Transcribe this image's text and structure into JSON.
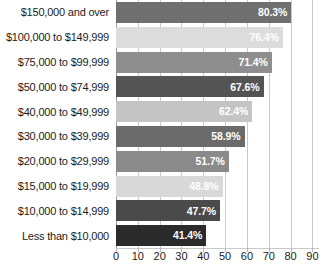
{
  "chart_data": {
    "type": "bar",
    "orientation": "horizontal",
    "title": "",
    "subtitle": "",
    "xlabel": "",
    "ylabel": "",
    "xlim": [
      0,
      93
    ],
    "grid": true,
    "legend": false,
    "value_suffix": "%",
    "xticks": [
      0,
      10,
      20,
      30,
      40,
      50,
      60,
      70,
      80,
      90
    ],
    "xtick_labels": [
      "0",
      "10",
      "20",
      "30",
      "40",
      "50",
      "60",
      "70",
      "80",
      "90"
    ],
    "categories": [
      "$150,000 and over",
      "$100,000 to $149,999",
      "$75,000 to $99,999",
      "$50,000 to $74,999",
      "$40,000 to $49,999",
      "$30,000 to $39,999",
      "$20,000 to $29,999",
      "$15,000 to $19,999",
      "$10,000 to $14,999",
      "Less than $10,000"
    ],
    "values": [
      80.3,
      76.4,
      71.4,
      67.6,
      62.4,
      58.9,
      51.7,
      48.8,
      47.7,
      41.4
    ],
    "value_labels": [
      "80.3%",
      "76.4%",
      "71.4%",
      "67.6%",
      "62.4%",
      "58.9%",
      "51.7%",
      "48.8%",
      "47.7%",
      "41.4%"
    ],
    "bar_colors": [
      "#6f6f6f",
      "#dcdcdc",
      "#8e8e8e",
      "#545454",
      "#c4c4c4",
      "#6b6b6b",
      "#8a8a8a",
      "#d8d8d8",
      "#4a4a4a",
      "#2b2b2b"
    ],
    "value_label_color": "#ffffff",
    "gridline_color": "#c9c9c9",
    "background_color": "#ffffff",
    "text_color": "#1b1b1b"
  }
}
